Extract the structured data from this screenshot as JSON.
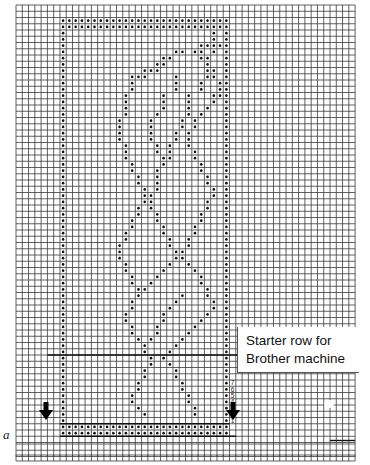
{
  "chart": {
    "type": "knitting-punchcard-chart",
    "grid": {
      "left": 16,
      "top": 5,
      "cols": 54,
      "rows": 70,
      "cell_w": 6.28,
      "cell_h": 6.25,
      "line_color": "#3a3a3a",
      "lower_strip": {
        "top": 444,
        "rows": 2
      },
      "bottom_strip": {
        "top": 455,
        "height": 6
      }
    },
    "pattern": {
      "col_start": 7,
      "col_end": 33,
      "top_row": 2,
      "bottom_row": 68,
      "starter_divider_row": 56,
      "dot_color": "#111111"
    },
    "row_numbers": [
      "7",
      "6",
      "5",
      "4",
      "3",
      "2",
      "1"
    ],
    "arrows": [
      {
        "name": "left-arrow",
        "x": 46,
        "y": 402
      },
      {
        "name": "right-arrow",
        "x": 233,
        "y": 402
      }
    ]
  },
  "labels": {
    "a": "a",
    "starter_line1": "Starter row for",
    "starter_line2": "Brother machine"
  },
  "motif_dots": [
    [
      4,
      31
    ],
    [
      4,
      35
    ],
    [
      5,
      31
    ],
    [
      5,
      35
    ],
    [
      5,
      36
    ],
    [
      6,
      29
    ],
    [
      6,
      30
    ],
    [
      6,
      31
    ],
    [
      6,
      32
    ],
    [
      6,
      34
    ],
    [
      6,
      36
    ],
    [
      7,
      25
    ],
    [
      7,
      26
    ],
    [
      7,
      28
    ],
    [
      7,
      29
    ],
    [
      7,
      31
    ],
    [
      7,
      33
    ],
    [
      7,
      34
    ],
    [
      8,
      23
    ],
    [
      8,
      24
    ],
    [
      8,
      29
    ],
    [
      8,
      30
    ],
    [
      9,
      22
    ],
    [
      9,
      23
    ],
    [
      9,
      30
    ],
    [
      10,
      20
    ],
    [
      10,
      21
    ],
    [
      10,
      22
    ],
    [
      10,
      30
    ],
    [
      10,
      31
    ],
    [
      11,
      18
    ],
    [
      11,
      19
    ],
    [
      11,
      20
    ],
    [
      11,
      25
    ],
    [
      11,
      30
    ],
    [
      11,
      31
    ],
    [
      12,
      18
    ],
    [
      12,
      25
    ],
    [
      12,
      29
    ],
    [
      12,
      32
    ],
    [
      13,
      18
    ],
    [
      13,
      25
    ],
    [
      13,
      29
    ],
    [
      13,
      32
    ],
    [
      14,
      17
    ],
    [
      14,
      23
    ],
    [
      14,
      27
    ],
    [
      14,
      31
    ],
    [
      14,
      32
    ],
    [
      15,
      17
    ],
    [
      15,
      23
    ],
    [
      15,
      27
    ],
    [
      15,
      31
    ],
    [
      16,
      17
    ],
    [
      16,
      23
    ],
    [
      16,
      27
    ],
    [
      16,
      30
    ],
    [
      17,
      17
    ],
    [
      17,
      22
    ],
    [
      17,
      27
    ],
    [
      17,
      29
    ],
    [
      18,
      16
    ],
    [
      18,
      21
    ],
    [
      18,
      26
    ],
    [
      18,
      28
    ],
    [
      19,
      16
    ],
    [
      19,
      21
    ],
    [
      19,
      26
    ],
    [
      19,
      28
    ],
    [
      20,
      16
    ],
    [
      20,
      21
    ],
    [
      20,
      25
    ],
    [
      20,
      27
    ],
    [
      21,
      16
    ],
    [
      21,
      21
    ],
    [
      21,
      25
    ],
    [
      21,
      27
    ],
    [
      22,
      17
    ],
    [
      22,
      22
    ],
    [
      22,
      24
    ],
    [
      22,
      27
    ],
    [
      23,
      17
    ],
    [
      23,
      22
    ],
    [
      23,
      24
    ],
    [
      23,
      28
    ],
    [
      24,
      17
    ],
    [
      24,
      23
    ],
    [
      24,
      24
    ],
    [
      24,
      28
    ],
    [
      25,
      18
    ],
    [
      25,
      23
    ],
    [
      25,
      29
    ],
    [
      26,
      18
    ],
    [
      26,
      22
    ],
    [
      26,
      29
    ],
    [
      27,
      19
    ],
    [
      27,
      22
    ],
    [
      27,
      30
    ],
    [
      28,
      19
    ],
    [
      28,
      22
    ],
    [
      28,
      30
    ],
    [
      29,
      20
    ],
    [
      29,
      22
    ],
    [
      29,
      31
    ],
    [
      30,
      20
    ],
    [
      30,
      21
    ],
    [
      30,
      31
    ],
    [
      31,
      20
    ],
    [
      31,
      21
    ],
    [
      31,
      30
    ],
    [
      32,
      19
    ],
    [
      32,
      21
    ],
    [
      32,
      30
    ],
    [
      33,
      19
    ],
    [
      33,
      22
    ],
    [
      33,
      29
    ],
    [
      34,
      18
    ],
    [
      34,
      22
    ],
    [
      34,
      29
    ],
    [
      35,
      18
    ],
    [
      35,
      23
    ],
    [
      35,
      28
    ],
    [
      36,
      17
    ],
    [
      36,
      23
    ],
    [
      36,
      28
    ],
    [
      37,
      17
    ],
    [
      37,
      24
    ],
    [
      37,
      27
    ],
    [
      38,
      16
    ],
    [
      38,
      24
    ],
    [
      38,
      27
    ],
    [
      39,
      16
    ],
    [
      39,
      25
    ],
    [
      39,
      26
    ],
    [
      40,
      16
    ],
    [
      40,
      25
    ],
    [
      40,
      26
    ],
    [
      41,
      17
    ],
    [
      41,
      24
    ],
    [
      41,
      27
    ],
    [
      42,
      17
    ],
    [
      42,
      23
    ],
    [
      42,
      28
    ],
    [
      43,
      18
    ],
    [
      43,
      22
    ],
    [
      43,
      29
    ],
    [
      44,
      18
    ],
    [
      44,
      21
    ],
    [
      44,
      29
    ],
    [
      45,
      19
    ],
    [
      45,
      20
    ],
    [
      45,
      30
    ],
    [
      46,
      19
    ],
    [
      46,
      26
    ],
    [
      46,
      30
    ],
    [
      47,
      18
    ],
    [
      47,
      25
    ],
    [
      47,
      31
    ],
    [
      48,
      18
    ],
    [
      48,
      24
    ],
    [
      48,
      31
    ],
    [
      49,
      17
    ],
    [
      49,
      23
    ],
    [
      49,
      30
    ],
    [
      50,
      17
    ],
    [
      50,
      23
    ],
    [
      50,
      29
    ],
    [
      51,
      18
    ],
    [
      51,
      22
    ],
    [
      51,
      28
    ],
    [
      52,
      18
    ],
    [
      52,
      22
    ],
    [
      52,
      27
    ],
    [
      53,
      19
    ],
    [
      53,
      21
    ],
    [
      53,
      26
    ],
    [
      54,
      20
    ],
    [
      54,
      25
    ],
    [
      55,
      20
    ],
    [
      55,
      24
    ],
    [
      56,
      21
    ],
    [
      56,
      23
    ],
    [
      57,
      21
    ],
    [
      57,
      24
    ],
    [
      58,
      20
    ],
    [
      58,
      25
    ],
    [
      59,
      20
    ],
    [
      59,
      25
    ],
    [
      60,
      19
    ],
    [
      60,
      26
    ],
    [
      61,
      19
    ],
    [
      61,
      26
    ],
    [
      62,
      18
    ],
    [
      62,
      27
    ],
    [
      63,
      18
    ],
    [
      63,
      27
    ],
    [
      64,
      19
    ],
    [
      64,
      28
    ],
    [
      65,
      20
    ],
    [
      65,
      28
    ]
  ]
}
